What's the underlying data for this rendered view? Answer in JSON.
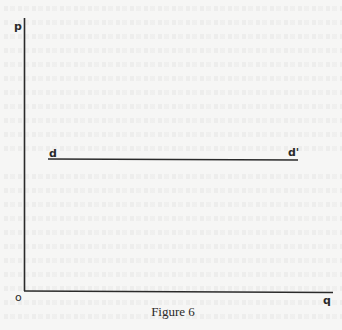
{
  "figure": {
    "caption": "Figure 6",
    "axes": {
      "y_axis_label": "p",
      "x_axis_label": "q",
      "origin_label": "o"
    },
    "curve": {
      "start_label": "d",
      "end_label": "d'",
      "shape": "horizontal line"
    },
    "colors": {
      "ink": "#2a2a2a",
      "paper": "#f6f6f5"
    }
  }
}
